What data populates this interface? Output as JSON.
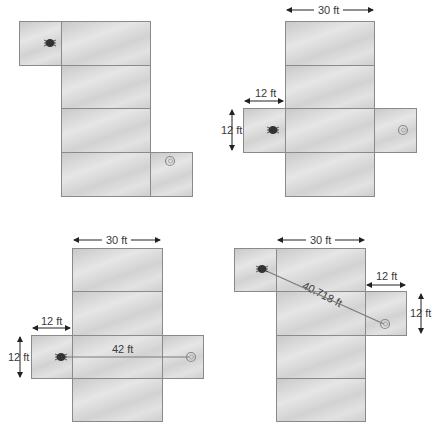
{
  "diagram": {
    "type": "room-net-shortest-path",
    "dimensions": {
      "length": "30 ft",
      "width_label": "12 ft",
      "height_label": "12 ft"
    },
    "nets": [
      {
        "id": "A",
        "labels": [],
        "path_label": null
      },
      {
        "id": "B",
        "top_label": "30 ft",
        "side_label_h": "12 ft",
        "side_label_v": "12 ft",
        "path_label": null
      },
      {
        "id": "C",
        "top_label": "30 ft",
        "side_label_h": "12 ft",
        "side_label_v": "12 ft",
        "path_label": "42 ft"
      },
      {
        "id": "D",
        "top_label": "30 ft",
        "side_label_h": "12 ft",
        "side_label_v": "12 ft",
        "path_label": "40.718 ft"
      }
    ],
    "icons": {
      "start": "bug-icon",
      "end": "spider-icon"
    },
    "colors": {
      "panel_border": "#8a8a8a",
      "panel_fill": "#d8d8d8",
      "path_line": "#7a7a7a",
      "text": "#3a3a3a"
    }
  }
}
